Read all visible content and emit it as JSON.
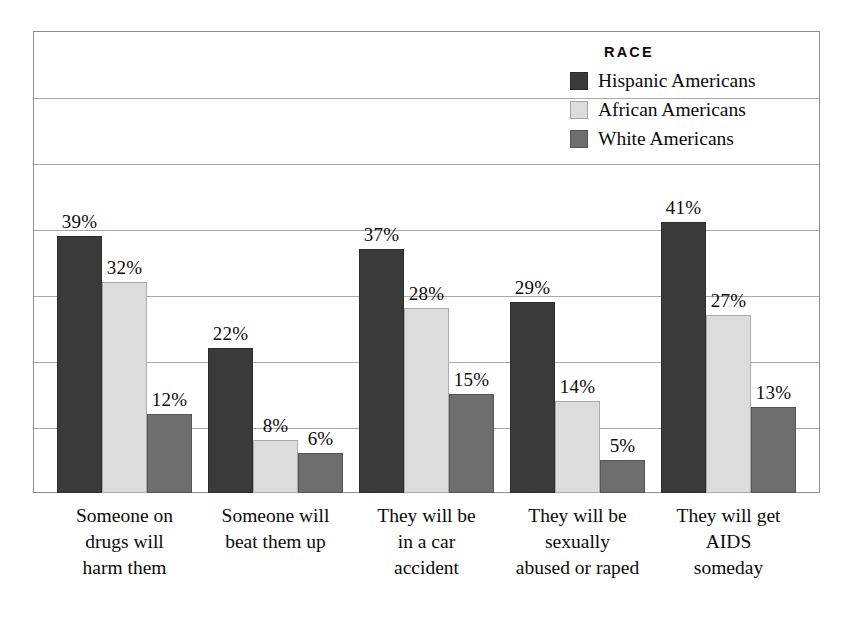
{
  "chart_data": {
    "type": "bar",
    "title": "",
    "xlabel": "",
    "ylabel": "",
    "ylim": [
      0,
      70
    ],
    "grid": true,
    "gridline_step": 10,
    "legend_position": "top-right",
    "legend_title": "RACE",
    "value_label_suffix": "%",
    "categories": [
      "Someone on drugs will harm them",
      "Someone will beat them up",
      "They will be in a car accident",
      "They will be sexually abused or raped",
      "They will get AIDS someday"
    ],
    "category_lines": [
      [
        "Someone on",
        "drugs will",
        "harm them"
      ],
      [
        "Someone will",
        "beat them up"
      ],
      [
        "They will be",
        "in a car",
        "accident"
      ],
      [
        "They will be",
        "sexually",
        "abused or raped"
      ],
      [
        "They will get",
        "AIDS",
        "someday"
      ]
    ],
    "series": [
      {
        "name": "Hispanic Americans",
        "color": "#3a3a3a",
        "values": [
          39,
          22,
          37,
          29,
          41
        ],
        "labels": [
          "39%",
          "22%",
          "37%",
          "29%",
          "41%"
        ]
      },
      {
        "name": "African Americans",
        "color": "#dcdcdc",
        "values": [
          32,
          8,
          28,
          14,
          27
        ],
        "labels": [
          "32%",
          "8%",
          "28%",
          "14%",
          "27%"
        ]
      },
      {
        "name": "White Americans",
        "color": "#6e6e6e",
        "values": [
          12,
          6,
          15,
          5,
          13
        ],
        "labels": [
          "12%",
          "6%",
          "15%",
          "5%",
          "13%"
        ]
      }
    ]
  },
  "legend": {
    "title": "RACE",
    "items": [
      {
        "label": "Hispanic Americans",
        "color": "#3a3a3a"
      },
      {
        "label": "African Americans",
        "color": "#dcdcdc"
      },
      {
        "label": "White Americans",
        "color": "#6e6e6e"
      }
    ]
  },
  "colors": {
    "frame": "#8d8d8d",
    "gridline": "#a9a9a9",
    "background": "#ffffff",
    "text": "#0b0b0b"
  }
}
